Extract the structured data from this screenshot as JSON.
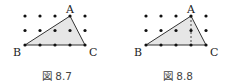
{
  "figures": [
    {
      "caption": "図 8.7",
      "labels": {
        "A": "A",
        "B": "B",
        "C": "C"
      },
      "grid": {
        "cols": 5,
        "rows": 3,
        "x0": 25,
        "y0": 16,
        "dx": 15,
        "dy": 14.5
      },
      "triangle": {
        "A": [
          70,
          16
        ],
        "B": [
          25,
          45
        ],
        "C": [
          85,
          45
        ]
      },
      "dashed_altitude": false
    },
    {
      "caption": "図 8.8",
      "labels": {
        "A": "A",
        "B": "B",
        "C": "C"
      },
      "grid": {
        "cols": 5,
        "rows": 3,
        "x0": 146,
        "y0": 16,
        "dx": 15,
        "dy": 14.5
      },
      "triangle": {
        "A": [
          191,
          16
        ],
        "B": [
          146,
          45
        ],
        "C": [
          206,
          45
        ]
      },
      "dashed_altitude": true
    }
  ],
  "colors": {
    "fill": "#e6e6e6",
    "stroke": "#333333",
    "dot": "#111111"
  }
}
